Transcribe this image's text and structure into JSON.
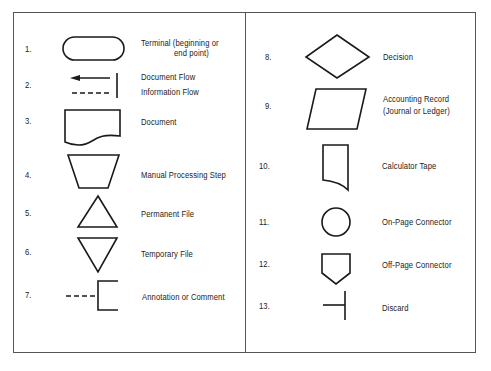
{
  "figure": {
    "left_column": [
      {
        "number": "1.",
        "symbol": "terminal",
        "label_line1": "Terminal (beginning or",
        "label_line2": "end point)"
      },
      {
        "number": "2.",
        "symbol": "flow-lines",
        "label_line1": "Document Flow",
        "label_line2": "Information Flow"
      },
      {
        "number": "3.",
        "symbol": "document",
        "label_line1": "Document"
      },
      {
        "number": "4.",
        "symbol": "manual-processing-step",
        "label_line1": "Manual Processing Step"
      },
      {
        "number": "5.",
        "symbol": "permanent-file",
        "label_line1": "Permanent File"
      },
      {
        "number": "6.",
        "symbol": "temporary-file",
        "label_line1": "Temporary File"
      },
      {
        "number": "7.",
        "symbol": "annotation",
        "label_line1": "Annotation or Comment"
      }
    ],
    "right_column": [
      {
        "number": "8.",
        "symbol": "decision",
        "label_line1": "Decision"
      },
      {
        "number": "9.",
        "symbol": "accounting-record",
        "label_line1": "Accounting Record",
        "label_line2": "(Journal or Ledger)"
      },
      {
        "number": "10.",
        "symbol": "calculator-tape",
        "label_line1": "Calculator Tape"
      },
      {
        "number": "11.",
        "symbol": "on-page-connector",
        "label_line1": "On-Page Connector"
      },
      {
        "number": "12.",
        "symbol": "off-page-connector",
        "label_line1": "Off-Page Connector"
      },
      {
        "number": "13.",
        "symbol": "discard",
        "label_line1": "Discard"
      }
    ],
    "colors": {
      "stroke": "#1a1a1a",
      "border": "#555555",
      "background": "#ffffff"
    }
  }
}
